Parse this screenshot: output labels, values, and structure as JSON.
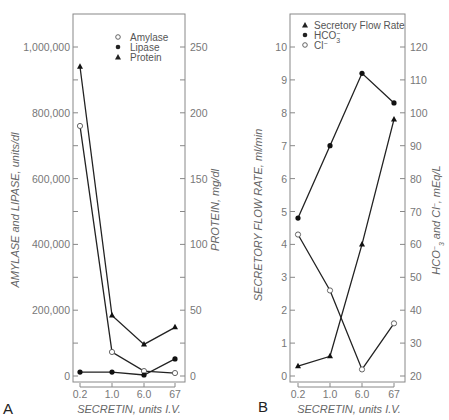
{
  "chart_data": [
    {
      "type": "line",
      "panel": "A",
      "title": "",
      "xlabel": "SECRETIN, units I.V.",
      "ylabel": "AMYLASE and LIPASE, units/dl",
      "ylabel_right": "PROTEIN, mg/dl",
      "categories": [
        "0.2",
        "1.0",
        "6.0",
        "67"
      ],
      "ylim": [
        0,
        1100000
      ],
      "ylim_right": [
        0,
        275
      ],
      "yticks": [
        "0",
        "200,000",
        "400,000",
        "600,000",
        "800,000",
        "1,000,000"
      ],
      "yticks_right": [
        "0",
        "50",
        "100",
        "150",
        "200",
        "250"
      ],
      "legend": [
        "Amylase",
        "Lipase",
        "Protein"
      ],
      "legend_position": "upper right",
      "grid": false,
      "series": [
        {
          "name": "Amylase",
          "marker": "open-circle",
          "axis": "left",
          "values": [
            760000,
            73000,
            15000,
            9000
          ]
        },
        {
          "name": "Lipase",
          "marker": "filled-circle",
          "axis": "left",
          "values": [
            12000,
            12000,
            3000,
            52000
          ]
        },
        {
          "name": "Protein",
          "marker": "filled-triangle",
          "axis": "right",
          "values": [
            235,
            46,
            24,
            37
          ]
        }
      ]
    },
    {
      "type": "line",
      "panel": "B",
      "title": "",
      "xlabel": "SECRETIN, units I.V.",
      "ylabel": "SECRETORY FLOW RATE, ml/min",
      "ylabel_right": "HCO3- and Cl-, mEq/L",
      "categories": [
        "0.2",
        "1.0",
        "6.0",
        "67"
      ],
      "ylim": [
        0,
        11
      ],
      "ylim_right": [
        20,
        130
      ],
      "yticks": [
        "0",
        "1",
        "2",
        "3",
        "4",
        "5",
        "6",
        "7",
        "8",
        "9",
        "10"
      ],
      "yticks_right": [
        "20",
        "30",
        "40",
        "50",
        "60",
        "70",
        "80",
        "90",
        "100",
        "110",
        "120"
      ],
      "legend": [
        "Secretory Flow Rate",
        "HCO3-",
        "Cl-"
      ],
      "legend_position": "upper left",
      "grid": false,
      "series": [
        {
          "name": "Secretory Flow Rate",
          "marker": "filled-triangle",
          "axis": "left",
          "values": [
            0.3,
            0.6,
            4.0,
            7.8
          ]
        },
        {
          "name": "HCO3-",
          "marker": "filled-circle",
          "axis": "right",
          "values": [
            68,
            90,
            112,
            103
          ]
        },
        {
          "name": "Cl-",
          "marker": "open-circle",
          "axis": "right",
          "values": [
            63,
            46,
            22,
            36
          ]
        }
      ]
    }
  ],
  "labels": {
    "panelA": "A",
    "panelB": "B",
    "xlabelA": "SECRETIN, units I.V.",
    "xlabelB": "SECRETIN, units I.V.",
    "ylabelA": "AMYLASE and LIPASE, units/dl",
    "ylabelA_right": "PROTEIN, mg/dl",
    "ylabelB": "SECRETORY FLOW RATE, ml/min",
    "ylabelB_right_a": "HCO",
    "ylabelB_right_b": " and Cl",
    "ylabelB_right_c": ", mEq/L",
    "legendA": [
      "Amylase",
      "Lipase",
      "Protein"
    ],
    "legendB": [
      "Secretory Flow Rate",
      "HCO",
      "Cl"
    ]
  }
}
